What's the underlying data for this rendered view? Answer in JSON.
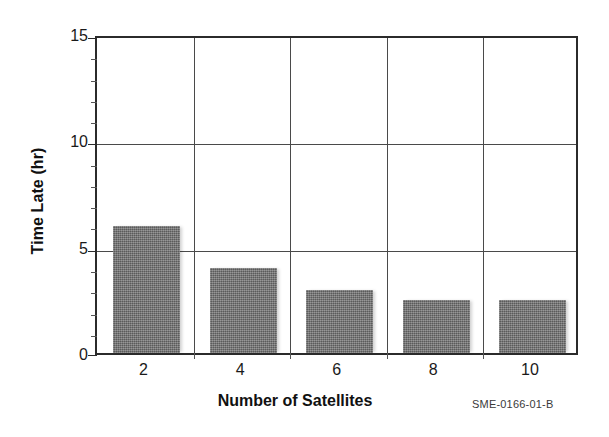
{
  "figure": {
    "id_label": "SME-0166-01-B",
    "background_color": "#ffffff",
    "bar_color": "#6f6f6f",
    "axis_color": "#2b2b2b",
    "grid_color": "#4a4a4a"
  },
  "chart_data": {
    "type": "bar",
    "title": "",
    "subtitle": "",
    "xlabel": "Number of Satellites",
    "ylabel": "Time Late (hr)",
    "categories": [
      "2",
      "4",
      "6",
      "8",
      "10"
    ],
    "values": [
      12,
      6,
      4,
      3,
      2.5
    ],
    "series": [
      {
        "name": "Time Late",
        "values": [
          12,
          6,
          4,
          3,
          2.5
        ]
      }
    ],
    "xlim": [
      0,
      5
    ],
    "ylim": [
      0,
      15
    ],
    "y_ticks": [
      "0",
      "5",
      "10",
      "15"
    ],
    "y_tick_values": [
      0,
      5,
      10,
      15
    ],
    "y_minor_tick_step": 1,
    "x_ticks": [
      "2",
      "4",
      "6",
      "8",
      "10"
    ],
    "grid": "horizontal-and-vertical",
    "legend": "none",
    "annotations": [
      "SME-0166-01-B"
    ]
  }
}
